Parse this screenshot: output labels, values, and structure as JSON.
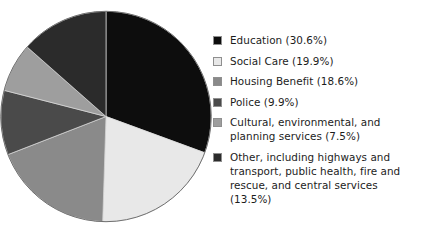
{
  "chart_data": {
    "type": "pie",
    "title": "",
    "labels": [
      "Education",
      "Social Care",
      "Housing Benefit",
      "Police",
      "Cultural, environmental, and planning services",
      "Other, including highways and transport, public health, fire and rescue, and central services"
    ],
    "values": [
      30.6,
      19.9,
      18.6,
      9.9,
      7.5,
      13.5
    ],
    "unit": "%",
    "start_angle_deg": 0,
    "direction": "clockwise",
    "legend_position": "right",
    "grid": false,
    "slices": [
      {
        "label": "Education",
        "value": 30.6,
        "color": "#0d0d0d"
      },
      {
        "label": "Social Care",
        "value": 19.9,
        "color": "#e8e8e8"
      },
      {
        "label": "Housing Benefit",
        "value": 18.6,
        "color": "#8a8a8a"
      },
      {
        "label": "Police",
        "value": 9.9,
        "color": "#4a4a4a"
      },
      {
        "label": "Cultural, environmental, and planning services",
        "value": 7.5,
        "color": "#9e9e9e"
      },
      {
        "label": "Other, including highways and transport, public health, fire and rescue, and central services",
        "value": 13.5,
        "color": "#2b2b2b"
      }
    ]
  },
  "legend": {
    "items": [
      {
        "text": "Education (30.6%)",
        "color": "#0d0d0d"
      },
      {
        "text": "Social Care (19.9%)",
        "color": "#e8e8e8"
      },
      {
        "text": "Housing Benefit (18.6%)",
        "color": "#8a8a8a"
      },
      {
        "text": "Police (9.9%)",
        "color": "#4a4a4a"
      },
      {
        "text": "Cultural, environmental, and\nplanning services (7.5%)",
        "color": "#9e9e9e"
      },
      {
        "text": "Other, including highways and\ntransport, public health, fire and\nrescue, and central services (13.5%)",
        "color": "#2b2b2b"
      }
    ]
  },
  "pie": {
    "outline_color": "#707070"
  }
}
